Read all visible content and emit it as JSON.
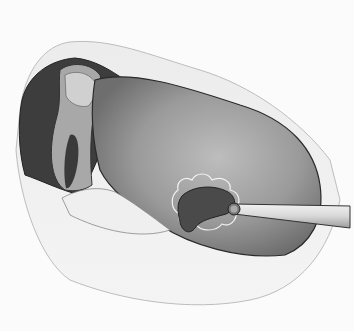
{
  "image": {
    "kind": "medical-illustration",
    "style": "grayscale pencil drawing",
    "description": "Open cavity view with a large rounded tissue mass, a dark kidney-shaped lesion outlined by a scalloped margin, and a probe instrument entering from the right",
    "colors": {
      "background": "#fbfbfb",
      "outer_tissue": "#e9e9e9",
      "cavity_dark": "#3a3a3a",
      "mass": "#8c8c8c",
      "mass_light": "#b4b4b4",
      "lesion": "#4a4a4a",
      "probe": "#dcdcdc",
      "outline": "#2a2a2a"
    }
  }
}
